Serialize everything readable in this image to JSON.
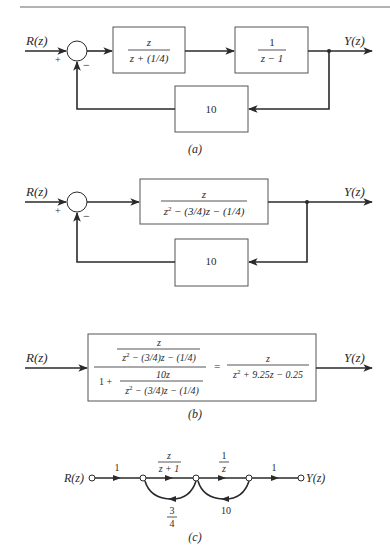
{
  "figure_a": {
    "input_label": "R(z)",
    "output_label": "Y(z)",
    "plus_sign": "+",
    "minus_sign": "−",
    "block1": {
      "numerator": "z",
      "denominator": "z + (1/4)"
    },
    "block2": {
      "numerator": "1",
      "denominator": "z − 1"
    },
    "feedback_block": "10",
    "caption": "(a)"
  },
  "figure_b_loop": {
    "input_label": "R(z)",
    "output_label": "Y(z)",
    "plus_sign": "+",
    "minus_sign": "−",
    "forward_block": {
      "numerator": "z",
      "denominator_base": "z",
      "denominator_exp": "2",
      "denominator_rest": " − (3/4)z − (1/4)"
    },
    "feedback_block": "10"
  },
  "figure_b_reduced": {
    "input_label": "R(z)",
    "output_label": "Y(z)",
    "top_num": "z",
    "top_den_base": "z",
    "top_den_exp": "2",
    "top_den_rest": " − (3/4)z − (1/4)",
    "one_plus": "1 +",
    "bottom_num": "10z",
    "bottom_den_base": "z",
    "bottom_den_exp": "2",
    "bottom_den_rest": " − (3/4)z − (1/4)",
    "equals": "=",
    "result_num": "z",
    "result_den_base": "z",
    "result_den_exp": "2",
    "result_den_rest": " + 9.25z − 0.25",
    "caption": "(b)"
  },
  "figure_c": {
    "input_label": "R(z)",
    "output_label": "Y(z)",
    "branch_gains": [
      "1",
      "z",
      "z + 1",
      "1",
      "z",
      "1"
    ],
    "feedback_gain_1": {
      "numerator": "3",
      "denominator": "4"
    },
    "feedback_gain_2": "10",
    "caption": "(c)"
  }
}
